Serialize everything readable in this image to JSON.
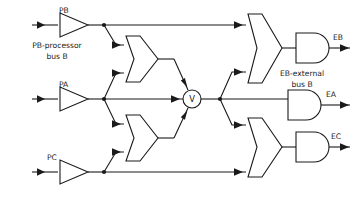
{
  "diagram": {
    "type": "logic-circuit",
    "background_color": "#ffffff",
    "line_color": "#1a1a1a",
    "inputs": [
      {
        "id": "PB",
        "label": "PB",
        "y": 25,
        "note_label": "PB-processor\nbus B",
        "note_line1": "PB-processor",
        "note_line2": "bus B"
      },
      {
        "id": "PA",
        "label": "PA",
        "y": 99,
        "note_line1": "",
        "note_line2": ""
      },
      {
        "id": "PC",
        "label": "PC",
        "y": 172,
        "note_line1": "",
        "note_line2": ""
      }
    ],
    "outputs": [
      {
        "id": "EB",
        "label": "EB",
        "y": 40,
        "note_line1": "EB-external",
        "note_line2": "bus B"
      },
      {
        "id": "EA",
        "label": "EA",
        "y": 104,
        "note_line1": "",
        "note_line2": ""
      },
      {
        "id": "EC",
        "label": "EC",
        "y": 156,
        "note_line1": "",
        "note_line2": ""
      }
    ],
    "gates": [
      {
        "id": "buf-pb",
        "kind": "buffer",
        "name": "buffer-pb"
      },
      {
        "id": "buf-pa",
        "kind": "buffer",
        "name": "buffer-pa"
      },
      {
        "id": "buf-pc",
        "kind": "buffer",
        "name": "buffer-pc"
      },
      {
        "id": "or-top",
        "kind": "or",
        "name": "or-gate-top",
        "inputs": 2
      },
      {
        "id": "or-bot",
        "kind": "or",
        "name": "or-gate-bottom",
        "inputs": 2
      },
      {
        "id": "or-eb",
        "kind": "or",
        "name": "or-gate-eb",
        "inputs": 2
      },
      {
        "id": "or-ec",
        "kind": "or",
        "name": "or-gate-ec",
        "inputs": 2
      },
      {
        "id": "and-eb",
        "kind": "and",
        "name": "and-gate-eb",
        "inputs": 1
      },
      {
        "id": "and-ea",
        "kind": "and",
        "name": "and-gate-ea",
        "inputs": 1
      },
      {
        "id": "and-ec",
        "kind": "and",
        "name": "and-gate-ec",
        "inputs": 1
      }
    ],
    "merge_node": {
      "id": "V",
      "label": "V",
      "cx": 192,
      "cy": 99,
      "r": 9
    }
  },
  "labels": {
    "pb": "PB",
    "pa": "PA",
    "pc": "PC",
    "eb": "EB",
    "ea": "EA",
    "ec": "EC",
    "pb_note_l1": "PB-processor",
    "pb_note_l2": "bus B",
    "eb_note_l1": "EB-external",
    "eb_note_l2": "bus B",
    "merge": "V"
  }
}
